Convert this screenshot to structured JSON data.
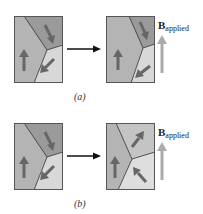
{
  "figures": [
    {
      "id": "a",
      "caption": "(a)",
      "field_label": {
        "symbol": "B",
        "subscript": "applied"
      },
      "before": {
        "domains": [
          {
            "name": "left-domain",
            "fill": "#b4b4b4",
            "moment": "up"
          },
          {
            "name": "top-right-domain",
            "fill": "#9a9a9a",
            "moment": "down-right"
          },
          {
            "name": "bottom-right-domain",
            "fill": "#d8d8d8",
            "moment": "down-left"
          }
        ]
      },
      "after": {
        "domains": [
          {
            "name": "left-domain",
            "fill": "#b4b4b4",
            "moment": "up",
            "note": "grown"
          },
          {
            "name": "top-right-domain",
            "fill": "#9a9a9a",
            "moment": "down-right",
            "note": "shrunk"
          },
          {
            "name": "bottom-right-domain",
            "fill": "#d8d8d8",
            "moment": "down-left",
            "note": "shrunk"
          }
        ]
      }
    },
    {
      "id": "b",
      "caption": "(b)",
      "field_label": {
        "symbol": "B",
        "subscript": "applied"
      },
      "before": {
        "domains": [
          {
            "name": "left-domain",
            "fill": "#b4b4b4",
            "moment": "up"
          },
          {
            "name": "top-right-domain",
            "fill": "#9a9a9a",
            "moment": "down-right"
          },
          {
            "name": "bottom-right-domain",
            "fill": "#d8d8d8",
            "moment": "down-left"
          }
        ]
      },
      "after": {
        "domains": [
          {
            "name": "left-domain",
            "fill": "#b4b4b4",
            "moment": "up"
          },
          {
            "name": "top-right-domain",
            "fill": "#c4c4c4",
            "moment": "up-right",
            "note": "rotated"
          },
          {
            "name": "bottom-right-domain",
            "fill": "#dedede",
            "moment": "up-left",
            "note": "rotated"
          }
        ]
      }
    }
  ],
  "colors": {
    "border": "#555555",
    "domain_wall": "#333333",
    "moment_arrow": "#666666",
    "field_arrow": "#aaaaaa",
    "transition_arrow": "#111111"
  }
}
